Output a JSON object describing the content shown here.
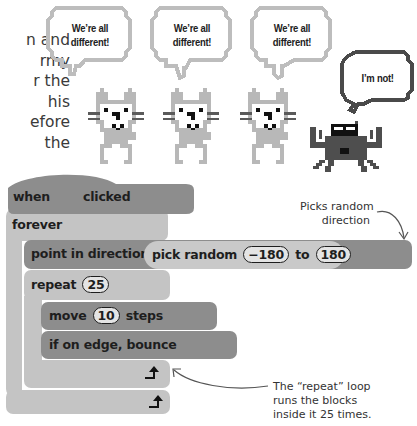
{
  "intro_text": {
    "lines": [
      "n and",
      "rmy",
      "r the",
      "his",
      "efore",
      "the"
    ]
  },
  "sprites": {
    "cats": [
      {
        "bubble": "We’re all different!"
      },
      {
        "bubble": "We’re all different!"
      },
      {
        "bubble": "We’re all different!"
      }
    ],
    "crab": {
      "bubble": "I’m not!"
    }
  },
  "script": {
    "hat": {
      "when": "when",
      "flag_icon": "green-flag-icon",
      "clicked": "clicked"
    },
    "forever": {
      "label": "forever"
    },
    "point": {
      "label": "point in direction",
      "reporter": "pick random",
      "from": "−180",
      "to_label": "to",
      "to": "180"
    },
    "repeat": {
      "label": "repeat",
      "count": "25"
    },
    "move": {
      "label": "move",
      "steps_value": "10",
      "steps_label": "steps"
    },
    "bounce": {
      "label": "if on edge, bounce"
    },
    "loop_arrow_icon": "loop-arrow-icon"
  },
  "annotations": {
    "random_direction": [
      "Picks random",
      "direction"
    ],
    "repeat_loop": [
      "The “repeat” loop",
      "runs the blocks",
      "inside it 25 times."
    ]
  },
  "colors": {
    "block_dark": "#8d8d8d",
    "block_light": "#c4c4c4",
    "text": "#1e1e1e",
    "sprite_gray": "#b5b5b5",
    "crab_dark": "#555555"
  }
}
